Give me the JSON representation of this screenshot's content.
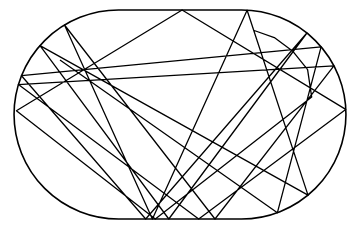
{
  "diagram": {
    "type": "stadium-billiard-trajectory",
    "background": "#ffffff",
    "stroke_color": "#000000",
    "boundary": {
      "shape": "stadium",
      "left": 14,
      "right": 346,
      "top": 10,
      "bottom": 219,
      "radius": 104.5
    },
    "trajectory": {
      "description": "Chaotic billiard ball path bouncing inside stadium boundary",
      "bounces": 90,
      "seed_angle": 0.6123,
      "start": [
        60,
        60
      ]
    }
  }
}
